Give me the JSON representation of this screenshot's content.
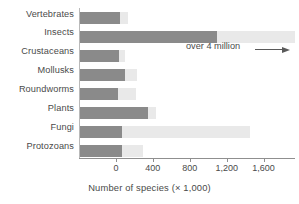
{
  "chart_data": {
    "type": "bar",
    "orientation": "horizontal",
    "title": "",
    "xlabel": "Number of species (× 1,000)",
    "ylabel": "",
    "xlim": [
      -400,
      1940
    ],
    "xticks": [
      0,
      400,
      800,
      1200,
      1600
    ],
    "xtick_labels": [
      "0",
      "400",
      "800",
      "1,200",
      "1,600"
    ],
    "grid": false,
    "legend": "none",
    "categories": [
      "Vertebrates",
      "Insects",
      "Crustaceans",
      "Mollusks",
      "Roundworms",
      "Plants",
      "Fungi",
      "Protozoans"
    ],
    "values": [
      45,
      1100,
      30,
      100,
      20,
      350,
      70,
      65
    ],
    "extent_values": [
      130,
      1940,
      95,
      230,
      215,
      430,
      1450,
      290
    ],
    "annotations": [
      {
        "text": "over 4 million",
        "target_category": "Insects",
        "arrow": "right"
      }
    ],
    "colors": {
      "bar": "#8a8a8a",
      "bar_extension": "#e9e9e9",
      "axis": "#8f8f8f",
      "text": "#4a4a4a",
      "background": "#ffffff"
    }
  },
  "axis": {
    "title": "Number of species (× 1,000)",
    "tick_labels": [
      "0",
      "400",
      "800",
      "1,200",
      "1,600"
    ]
  },
  "annotation": {
    "text": "over 4 million"
  }
}
